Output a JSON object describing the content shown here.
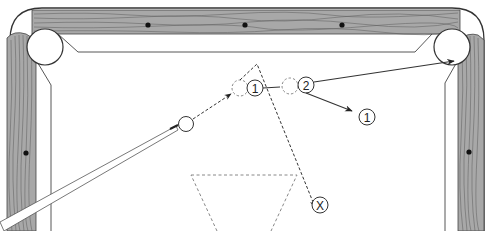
{
  "diagram": {
    "colors": {
      "wood": "#a8a8a8",
      "wood_grain": "#5a5a5a",
      "outline": "#333333",
      "diamond": "#111111",
      "cloth": "#ffffff"
    },
    "labels": {
      "object_ball_1": "1",
      "object_ball_2": "2",
      "ball_1_deflection": "1",
      "cue_ball_end": "X"
    },
    "elements": {
      "cue_ball": "cue ball (solid circle)",
      "ghost_ball_1": "ghost ball contact position for ball 1 (dashed)",
      "ghost_ball_2": "ghost ball contact position for ball 2 (dashed)",
      "rack_area": "dashed triangle (rack spot area)",
      "pocket_target": "top-right corner pocket"
    }
  }
}
